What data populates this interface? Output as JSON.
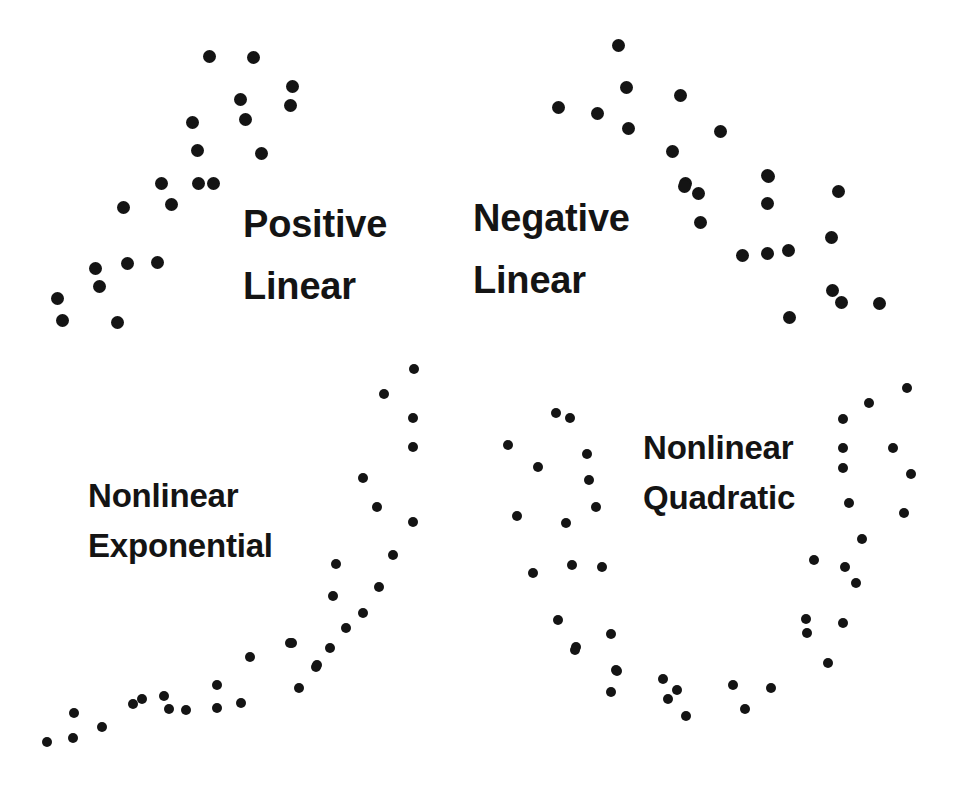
{
  "figure": {
    "width": 960,
    "height": 794,
    "background_color": "#ffffff",
    "dot_color": "#141414"
  },
  "chart_data": {
    "type": "scatter",
    "title": "",
    "xlabel": "",
    "ylabel": "",
    "grid": false,
    "axes_visible": false,
    "legend": "none",
    "panels": [
      {
        "id": "positive-linear",
        "label_lines": [
          "Positive",
          "Linear"
        ],
        "label_x": 243,
        "label_y_line1": 233,
        "label_y_line2": 295,
        "label_size": "label-lg",
        "dot_diameter": 13,
        "relationship": "positive linear",
        "points": [
          [
            209,
            56
          ],
          [
            253,
            57
          ],
          [
            292,
            86
          ],
          [
            240,
            99
          ],
          [
            290,
            105
          ],
          [
            245,
            119
          ],
          [
            192,
            122
          ],
          [
            197,
            150
          ],
          [
            261,
            153
          ],
          [
            161,
            183
          ],
          [
            198,
            183
          ],
          [
            213,
            183
          ],
          [
            123,
            207
          ],
          [
            171,
            204
          ],
          [
            95,
            268
          ],
          [
            127,
            263
          ],
          [
            157,
            262
          ],
          [
            99,
            286
          ],
          [
            57,
            298
          ],
          [
            62,
            320
          ],
          [
            117,
            322
          ]
        ]
      },
      {
        "id": "negative-linear",
        "label_lines": [
          "Negative",
          "Linear"
        ],
        "label_x": 473,
        "label_y_line1": 227,
        "label_y_line2": 289,
        "label_size": "label-lg",
        "dot_diameter": 13,
        "relationship": "negative linear",
        "points": [
          [
            618,
            45
          ],
          [
            626,
            87
          ],
          [
            558,
            107
          ],
          [
            680,
            95
          ],
          [
            597,
            113
          ],
          [
            628,
            128
          ],
          [
            720,
            131
          ],
          [
            672,
            151
          ],
          [
            767,
            175
          ],
          [
            685,
            183
          ],
          [
            684,
            186
          ],
          [
            698,
            193
          ],
          [
            768,
            176
          ],
          [
            838,
            191
          ],
          [
            700,
            222
          ],
          [
            767,
            203
          ],
          [
            831,
            237
          ],
          [
            742,
            255
          ],
          [
            767,
            253
          ],
          [
            788,
            250
          ],
          [
            832,
            290
          ],
          [
            841,
            302
          ],
          [
            879,
            303
          ],
          [
            789,
            317
          ]
        ]
      },
      {
        "id": "nonlinear-exponential",
        "label_lines": [
          "Nonlinear",
          "Exponential"
        ],
        "label_x": 88,
        "label_y_line1": 503,
        "label_y_line2": 553,
        "label_size": "label-sm",
        "dot_diameter": 10,
        "relationship": "nonlinear exponential",
        "points": [
          [
            47,
            742
          ],
          [
            73,
            738
          ],
          [
            74,
            713
          ],
          [
            102,
            727
          ],
          [
            133,
            704
          ],
          [
            142,
            699
          ],
          [
            164,
            696
          ],
          [
            169,
            709
          ],
          [
            186,
            710
          ],
          [
            217,
            685
          ],
          [
            217,
            708
          ],
          [
            241,
            703
          ],
          [
            250,
            657
          ],
          [
            290,
            643
          ],
          [
            299,
            688
          ],
          [
            316,
            667
          ],
          [
            292,
            643
          ],
          [
            317,
            665
          ],
          [
            330,
            648
          ],
          [
            346,
            628
          ],
          [
            363,
            613
          ],
          [
            333,
            596
          ],
          [
            379,
            587
          ],
          [
            336,
            564
          ],
          [
            393,
            555
          ],
          [
            413,
            522
          ],
          [
            377,
            507
          ],
          [
            363,
            478
          ],
          [
            413,
            447
          ],
          [
            413,
            418
          ],
          [
            384,
            394
          ],
          [
            414,
            369
          ]
        ]
      },
      {
        "id": "nonlinear-quadratic",
        "label_lines": [
          "Nonlinear",
          "Quadratic"
        ],
        "label_x": 643,
        "label_y_line1": 455,
        "label_y_line2": 505,
        "label_size": "label-sm",
        "dot_diameter": 10,
        "relationship": "nonlinear quadratic (U-shaped)",
        "points": [
          [
            556,
            413
          ],
          [
            570,
            418
          ],
          [
            508,
            445
          ],
          [
            587,
            454
          ],
          [
            538,
            467
          ],
          [
            589,
            480
          ],
          [
            596,
            507
          ],
          [
            517,
            516
          ],
          [
            566,
            523
          ],
          [
            533,
            573
          ],
          [
            572,
            565
          ],
          [
            602,
            567
          ],
          [
            558,
            620
          ],
          [
            611,
            634
          ],
          [
            576,
            647
          ],
          [
            616,
            670
          ],
          [
            575,
            650
          ],
          [
            617,
            671
          ],
          [
            611,
            692
          ],
          [
            663,
            679
          ],
          [
            677,
            690
          ],
          [
            668,
            699
          ],
          [
            686,
            716
          ],
          [
            733,
            685
          ],
          [
            745,
            709
          ],
          [
            771,
            688
          ],
          [
            828,
            663
          ],
          [
            806,
            619
          ],
          [
            843,
            623
          ],
          [
            807,
            633
          ],
          [
            814,
            560
          ],
          [
            845,
            567
          ],
          [
            856,
            583
          ],
          [
            862,
            539
          ],
          [
            849,
            503
          ],
          [
            904,
            513
          ],
          [
            911,
            474
          ],
          [
            843,
            468
          ],
          [
            893,
            448
          ],
          [
            843,
            448
          ],
          [
            843,
            419
          ],
          [
            869,
            403
          ],
          [
            907,
            388
          ]
        ]
      }
    ]
  }
}
